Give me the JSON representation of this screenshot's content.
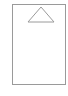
{
  "card": {
    "border_color": "#9a9a9a",
    "icon": "triangle-up-icon"
  }
}
